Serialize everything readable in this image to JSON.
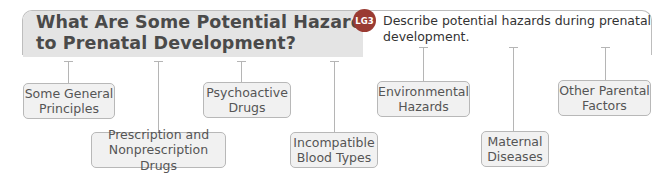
{
  "header": {
    "title_line1": "What Are Some Potential Hazards",
    "title_line2": "to Prenatal Development?",
    "badge": "LG3",
    "objective_line1": "Describe potential hazards during prenatal",
    "objective_line2": "development."
  },
  "colors": {
    "band": "#e4e4e4",
    "badge": "#9a3b33",
    "node_fill": "#f1f1f1",
    "node_border": "#b8b8b8",
    "line": "#b5b5b5"
  },
  "nodes": [
    {
      "line1": "Some General",
      "line2": "Principles"
    },
    {
      "line1": "Prescription and",
      "line2": "Nonprescription Drugs"
    },
    {
      "line1": "Psychoactive",
      "line2": "Drugs"
    },
    {
      "line1": "Incompatible",
      "line2": "Blood Types"
    },
    {
      "line1": "Environmental",
      "line2": "Hazards"
    },
    {
      "line1": "Maternal",
      "line2": "Diseases"
    },
    {
      "line1": "Other Parental",
      "line2": "Factors"
    }
  ]
}
